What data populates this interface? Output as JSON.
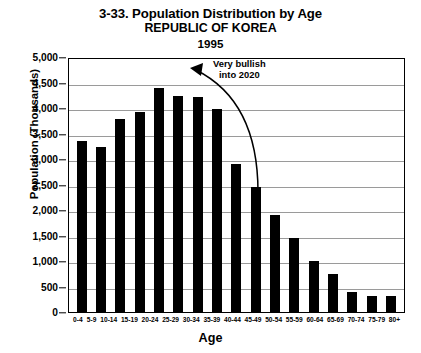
{
  "title": {
    "main": "3-33. Population Distribution by Age",
    "country": "REPUBLIC OF KOREA",
    "year": "1995"
  },
  "annotation": {
    "line1": "Very bullish",
    "line2": "into 2020"
  },
  "chart_data": {
    "type": "bar",
    "title": "3-33. Population Distribution by Age",
    "subtitle": "REPUBLIC OF KOREA 1995",
    "xlabel": "Age",
    "ylabel": "Population (Thousands)",
    "ylim": [
      0,
      5000
    ],
    "ytick_values": [
      0,
      500,
      1000,
      1500,
      2000,
      2500,
      3000,
      3500,
      4000,
      4500,
      5000
    ],
    "ytick_labels": [
      "0",
      "500",
      "1,000",
      "1,500",
      "2,000",
      "2,500",
      "3,000",
      "3,500",
      "4,000",
      "4,500",
      "5,000"
    ],
    "grid": true,
    "legend": null,
    "bar_color": "#000000",
    "categories": [
      "0-4",
      "5-9",
      "10-14",
      "15-19",
      "20-24",
      "25-29",
      "30-34",
      "35-39",
      "40-44",
      "45-49",
      "50-54",
      "55-59",
      "60-64",
      "65-69",
      "70-74",
      "75-79",
      "80+"
    ],
    "values": [
      3350,
      3230,
      3780,
      3930,
      4400,
      4230,
      4220,
      3990,
      2900,
      2450,
      1900,
      1450,
      1000,
      750,
      400,
      320,
      320
    ],
    "annotations": [
      {
        "text": "Very bullish into 2020",
        "arrow_from": [
          258,
          190
        ],
        "arrow_to": [
          192,
          68
        ]
      }
    ]
  }
}
